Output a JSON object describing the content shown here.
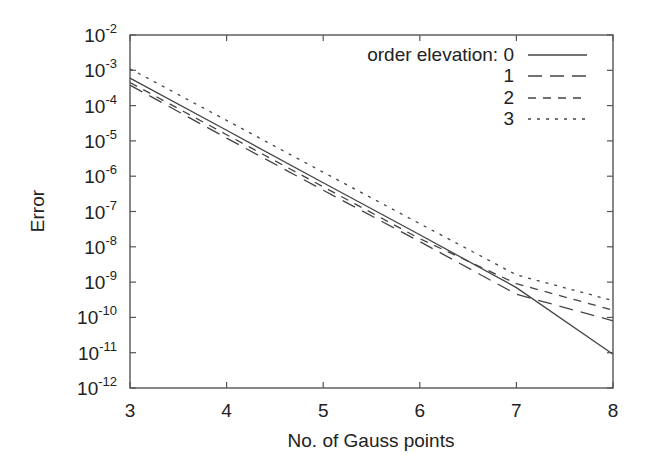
{
  "chart_data": {
    "type": "line",
    "title": "",
    "xlabel": "No. of Gauss points",
    "ylabel": "Error",
    "xlim": [
      3,
      8
    ],
    "ylim_log10": [
      -12,
      -2
    ],
    "yscale": "log",
    "grid": false,
    "legend_position": "top-right inside",
    "legend_title": "order elevation:",
    "x_ticks": [
      "3",
      "4",
      "5",
      "6",
      "7",
      "8"
    ],
    "y_ticks": [
      {
        "base": "10",
        "exp": "-2"
      },
      {
        "base": "10",
        "exp": "-3"
      },
      {
        "base": "10",
        "exp": "-4"
      },
      {
        "base": "10",
        "exp": "-5"
      },
      {
        "base": "10",
        "exp": "-6"
      },
      {
        "base": "10",
        "exp": "-7"
      },
      {
        "base": "10",
        "exp": "-8"
      },
      {
        "base": "10",
        "exp": "-9"
      },
      {
        "base": "10",
        "exp": "-10"
      },
      {
        "base": "10",
        "exp": "-11"
      },
      {
        "base": "10",
        "exp": "-12"
      }
    ],
    "x": [
      3,
      4,
      5,
      6,
      7,
      8
    ],
    "series": [
      {
        "name": "0",
        "style": "solid",
        "dash": "",
        "values": [
          0.0006,
          2e-05,
          6.5e-07,
          2.2e-08,
          7e-10,
          9e-12
        ]
      },
      {
        "name": "1",
        "style": "long-dash",
        "dash": "14,8",
        "values": [
          0.00038,
          1.2e-05,
          4e-07,
          1.4e-08,
          4.5e-10,
          8e-11
        ]
      },
      {
        "name": "2",
        "style": "dash",
        "dash": "8,7",
        "values": [
          0.00045,
          1.5e-05,
          5e-07,
          1.7e-08,
          9e-10,
          1.6e-10
        ]
      },
      {
        "name": "3",
        "style": "dotted",
        "dash": "3,6",
        "values": [
          0.0011,
          3.8e-05,
          1.3e-06,
          4.5e-08,
          1.6e-09,
          3e-10
        ]
      }
    ]
  },
  "legend": {
    "title": "order elevation:",
    "entries": [
      "0",
      "1",
      "2",
      "3"
    ]
  }
}
